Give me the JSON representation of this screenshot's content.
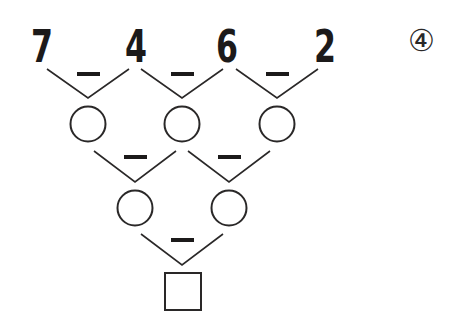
{
  "problem": {
    "label": "④",
    "operator": "−",
    "top_numbers": [
      "7",
      "4",
      "6",
      "2"
    ],
    "row2_blanks": 3,
    "row3_blanks": 2,
    "answer_box": ""
  },
  "colors": {
    "ink": "#1c1a1a",
    "background": "#ffffff"
  }
}
